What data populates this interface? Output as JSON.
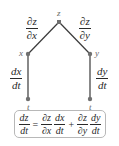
{
  "diagram": {
    "type": "chain-rule-tree",
    "nodes": {
      "top": "z",
      "left": "x",
      "right": "y",
      "bottom_left": "t",
      "bottom_right": "t"
    },
    "edges": {
      "z_x": {
        "num": "∂z",
        "den": "∂x"
      },
      "z_y": {
        "num": "∂z",
        "den": "∂y"
      },
      "x_t": {
        "num": "dx",
        "den": "dt"
      },
      "y_t": {
        "num": "dy",
        "den": "dt"
      }
    },
    "formula": {
      "lhs": {
        "num": "dz",
        "den": "dt"
      },
      "eq": "=",
      "term1a": {
        "num": "∂z",
        "den": "∂x"
      },
      "term1b": {
        "num": "dx",
        "den": "dt"
      },
      "plus": "+",
      "term2a": {
        "num": "∂z",
        "den": "∂y"
      },
      "term2b": {
        "num": "dy",
        "den": "dt"
      }
    },
    "colors": {
      "line": "#3a3a3a",
      "node": "#707070",
      "text": "#2a2a2a",
      "box_border": "#b8b8b8"
    }
  }
}
